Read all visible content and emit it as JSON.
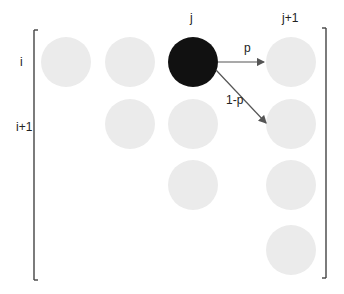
{
  "diagram": {
    "type": "lattice-transition",
    "row_labels": [
      {
        "text": "i",
        "x": 20,
        "y": 56
      },
      {
        "text": "i+1",
        "x": 16,
        "y": 121
      }
    ],
    "col_labels": [
      {
        "text": "j",
        "x": 190,
        "y": 12
      },
      {
        "text": "j+1",
        "x": 282,
        "y": 12
      }
    ],
    "edge_labels": [
      {
        "text": "p",
        "x": 244,
        "y": 42
      },
      {
        "text": "1-p",
        "x": 226,
        "y": 94
      }
    ],
    "colors": {
      "node_fill": "#ebebeb",
      "active_node_fill": "#111111",
      "arrow": "#555555",
      "bracket": "#444444"
    },
    "nodes": [
      {
        "row": "i",
        "col": 1,
        "cx": 66,
        "cy": 62,
        "active": false
      },
      {
        "row": "i",
        "col": 2,
        "cx": 130,
        "cy": 62,
        "active": false
      },
      {
        "row": "i",
        "col": "j",
        "cx": 193,
        "cy": 62,
        "active": true
      },
      {
        "row": "i",
        "col": "j+1",
        "cx": 291,
        "cy": 62,
        "active": false
      },
      {
        "row": "i+1",
        "col": 2,
        "cx": 130,
        "cy": 124,
        "active": false
      },
      {
        "row": "i+1",
        "col": "j",
        "cx": 193,
        "cy": 124,
        "active": false
      },
      {
        "row": "i+1",
        "col": "j+1",
        "cx": 291,
        "cy": 124,
        "active": false
      },
      {
        "row": 3,
        "col": "j",
        "cx": 193,
        "cy": 185,
        "active": false
      },
      {
        "row": 3,
        "col": "j+1",
        "cx": 291,
        "cy": 185,
        "active": false
      },
      {
        "row": 4,
        "col": "j+1",
        "cx": 291,
        "cy": 250,
        "active": false
      }
    ],
    "edges": [
      {
        "from": "(i,j)",
        "to": "(i,j+1)",
        "label": "p"
      },
      {
        "from": "(i,j)",
        "to": "(i+1,j+1)",
        "label": "1-p"
      }
    ]
  }
}
